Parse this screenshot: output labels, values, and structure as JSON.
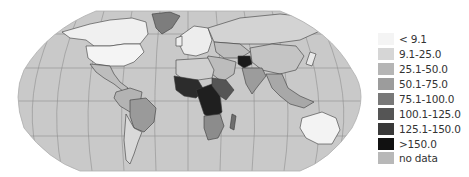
{
  "map": {
    "projection": "Robinson",
    "colors": {
      "ocean": "#c9c9c9",
      "graticule": "#8e8e8e",
      "border": "#3a3a3a"
    },
    "regions": [
      {
        "name": "canada",
        "fill": "#f0f0f0"
      },
      {
        "name": "usa",
        "fill": "#f4f4f4"
      },
      {
        "name": "greenland",
        "fill": "#7d7d7d"
      },
      {
        "name": "mexico-central-america",
        "fill": "#bdbdbd"
      },
      {
        "name": "south-america-north",
        "fill": "#b3b3b3"
      },
      {
        "name": "brazil",
        "fill": "#9a9a9a"
      },
      {
        "name": "south-america-south",
        "fill": "#d9d9d9"
      },
      {
        "name": "europe",
        "fill": "#ededed"
      },
      {
        "name": "russia",
        "fill": "#d3d3d3"
      },
      {
        "name": "central-asia",
        "fill": "#bdbdbd"
      },
      {
        "name": "middle-east",
        "fill": "#bcbcbc"
      },
      {
        "name": "south-asia",
        "fill": "#9c9c9c"
      },
      {
        "name": "afghanistan",
        "fill": "#1a1a1a"
      },
      {
        "name": "china",
        "fill": "#c4c4c4"
      },
      {
        "name": "southeast-asia",
        "fill": "#a8a8a8"
      },
      {
        "name": "north-africa",
        "fill": "#cfcfcf"
      },
      {
        "name": "west-africa",
        "fill": "#2c2c2c"
      },
      {
        "name": "central-africa",
        "fill": "#1f1f1f"
      },
      {
        "name": "east-africa",
        "fill": "#555555"
      },
      {
        "name": "southern-africa",
        "fill": "#8c8c8c"
      },
      {
        "name": "madagascar",
        "fill": "#6e6e6e"
      },
      {
        "name": "australia",
        "fill": "#f3f3f3"
      }
    ]
  },
  "legend": {
    "items": [
      {
        "label": "< 9.1",
        "color": "#f4f4f4"
      },
      {
        "label": "9.1-25.0",
        "color": "#d6d6d6"
      },
      {
        "label": "25.1-50.0",
        "color": "#b5b5b5"
      },
      {
        "label": "50.1-75.0",
        "color": "#9c9c9c"
      },
      {
        "label": "75.1-100.0",
        "color": "#787878"
      },
      {
        "label": "100.1-125.0",
        "color": "#555555"
      },
      {
        "label": "125.1-150.0",
        "color": "#393939"
      },
      {
        "label": ">150.0",
        "color": "#111111"
      },
      {
        "label": "no data",
        "color": "#b8b8b8"
      }
    ]
  }
}
